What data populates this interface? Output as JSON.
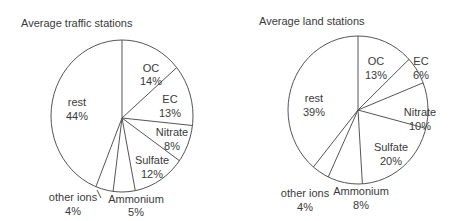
{
  "chart_data": [
    {
      "type": "pie",
      "title": "Average traffic stations",
      "categories": [
        "OC",
        "EC",
        "Nitrate",
        "Sulfate",
        "Ammonium",
        "other ions",
        "rest"
      ],
      "values": [
        14,
        13,
        8,
        12,
        5,
        4,
        44
      ],
      "value_labels": [
        "14%",
        "13%",
        "8%",
        "12%",
        "5%",
        "4%",
        "44%"
      ],
      "start_angle": "12 o'clock",
      "direction": "clockwise",
      "legend": "none (labels on/next to slices)",
      "fill": "white with dark outlines"
    },
    {
      "type": "pie",
      "title": "Average land stations",
      "categories": [
        "OC",
        "EC",
        "Nitrate",
        "Sulfate",
        "Ammonium",
        "other ions",
        "rest"
      ],
      "values": [
        13,
        6,
        10,
        20,
        8,
        4,
        39
      ],
      "value_labels": [
        "13%",
        "6%",
        "10%",
        "20%",
        "8%",
        "4%",
        "39%"
      ],
      "start_angle": "12 o'clock",
      "direction": "clockwise",
      "legend": "none (labels on/next to slices)",
      "fill": "white with dark outlines"
    }
  ],
  "colors": {
    "stroke": "#555555",
    "text": "#3a3a3a",
    "background": "#ffffff"
  }
}
